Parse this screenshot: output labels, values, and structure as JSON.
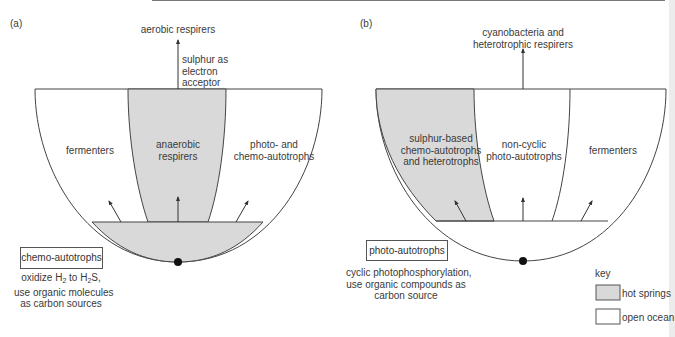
{
  "panels": {
    "a": {
      "tag": "(a)",
      "top_label": "aerobic respirers",
      "arrow_note": [
        "sulphur as",
        "electron",
        "acceptor"
      ],
      "columns": [
        "fermenters",
        "anaerobic respirers",
        "photo- and chemo-autotrophs"
      ],
      "column_lines": {
        "c1": "anaerobic",
        "c2": "respirers",
        "r1": "photo- and",
        "r2": "chemo-autotrophs"
      },
      "shaded_column": 1,
      "base_shaded": true,
      "root_box": "chemo-autotrophs",
      "root_desc": {
        "line1_a": "oxidize H",
        "sub1": "2",
        "line1_b": " to H",
        "sub2": "2",
        "line1_c": "S,",
        "line2": "use organic molecules",
        "line3": "as carbon sources"
      }
    },
    "b": {
      "tag": "(b)",
      "top_label": [
        "cyanobacteria and",
        "heterotrophic respirers"
      ],
      "columns": [
        "sulphur-based chemo-autotrophs and heterotrophs",
        "non-cyclic photo-autotrophs",
        "fermenters"
      ],
      "column_lines": {
        "l1": "sulphur-based",
        "l2": "chemo-autotrophs",
        "l3": "and heterotrophs",
        "c1": "non-cyclic",
        "c2": "photo-autotrophs",
        "r1": "fermenters"
      },
      "shaded_column": 0,
      "base_shaded": false,
      "root_box": "photo-autotrophs",
      "root_desc": [
        "cyclic photophosphorylation,",
        "use organic compounds as",
        "carbon source"
      ]
    }
  },
  "key": {
    "title": "key",
    "items": [
      {
        "label": "hot springs",
        "color": "#d9d9d9"
      },
      {
        "label": "open ocean",
        "color": "#ffffff"
      }
    ]
  },
  "colors": {
    "shade": "#d9d9d9",
    "stroke": "#444444"
  }
}
